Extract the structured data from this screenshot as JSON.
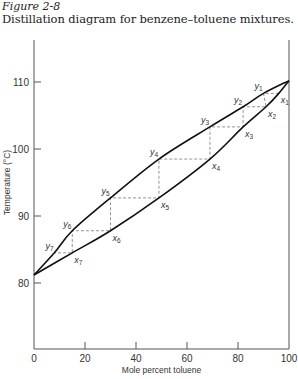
{
  "figure": {
    "number": "Figure 2-8",
    "caption": "Distillation diagram for benzene–toluene mixtures."
  },
  "chart_data": {
    "type": "line",
    "title": "Distillation diagram for benzene–toluene mixtures.",
    "xlabel": "Mole percent toluene",
    "ylabel": "Temperature (°C)",
    "xlim": [
      0,
      100
    ],
    "ylim": [
      70,
      116
    ],
    "xticks": [
      0,
      20,
      40,
      60,
      80,
      100
    ],
    "yticks": [
      80,
      90,
      100,
      110
    ],
    "grid": false,
    "legend": null,
    "series": [
      {
        "name": "Vapor curve (upper, y)",
        "x": [
          0,
          8,
          15,
          30,
          49,
          69,
          82,
          90,
          100
        ],
        "y": [
          81.2,
          84.5,
          87.8,
          92.7,
          98.5,
          103.3,
          106.3,
          108.3,
          110.2
        ]
      },
      {
        "name": "Liquid curve (lower, x)",
        "x": [
          0,
          15,
          30,
          49,
          69,
          82,
          91,
          96,
          100
        ],
        "y": [
          81.2,
          84.5,
          87.8,
          92.7,
          98.5,
          103.3,
          106.3,
          108.3,
          110.2
        ]
      }
    ],
    "staircase_points": [
      {
        "label": "x1",
        "x": 96,
        "T": 108.3
      },
      {
        "label": "y1",
        "x": 90,
        "T": 108.3
      },
      {
        "label": "x2",
        "x": 91,
        "T": 106.3
      },
      {
        "label": "y2",
        "x": 82,
        "T": 106.3
      },
      {
        "label": "x3",
        "x": 82,
        "T": 103.3
      },
      {
        "label": "y3",
        "x": 69,
        "T": 103.3
      },
      {
        "label": "x4",
        "x": 69,
        "T": 98.5
      },
      {
        "label": "y4",
        "x": 49,
        "T": 98.5
      },
      {
        "label": "x5",
        "x": 49,
        "T": 92.7
      },
      {
        "label": "y5",
        "x": 30,
        "T": 92.7
      },
      {
        "label": "x6",
        "x": 30,
        "T": 87.8
      },
      {
        "label": "y6",
        "x": 15,
        "T": 87.8
      },
      {
        "label": "x7",
        "x": 15,
        "T": 84.5
      },
      {
        "label": "y7",
        "x": 8,
        "T": 84.5
      }
    ],
    "annotations": [
      "y1",
      "y2",
      "y3",
      "y4",
      "y5",
      "y6",
      "y7",
      "x1",
      "x2",
      "x3",
      "x4",
      "x5",
      "x6",
      "x7"
    ]
  },
  "axis": {
    "x_ticks": [
      "0",
      "20",
      "40",
      "60",
      "80",
      "100"
    ],
    "y_ticks": [
      "80",
      "90",
      "100",
      "110"
    ],
    "x_label": "Mole percent toluene",
    "y_label": "Temperature (°C)"
  }
}
